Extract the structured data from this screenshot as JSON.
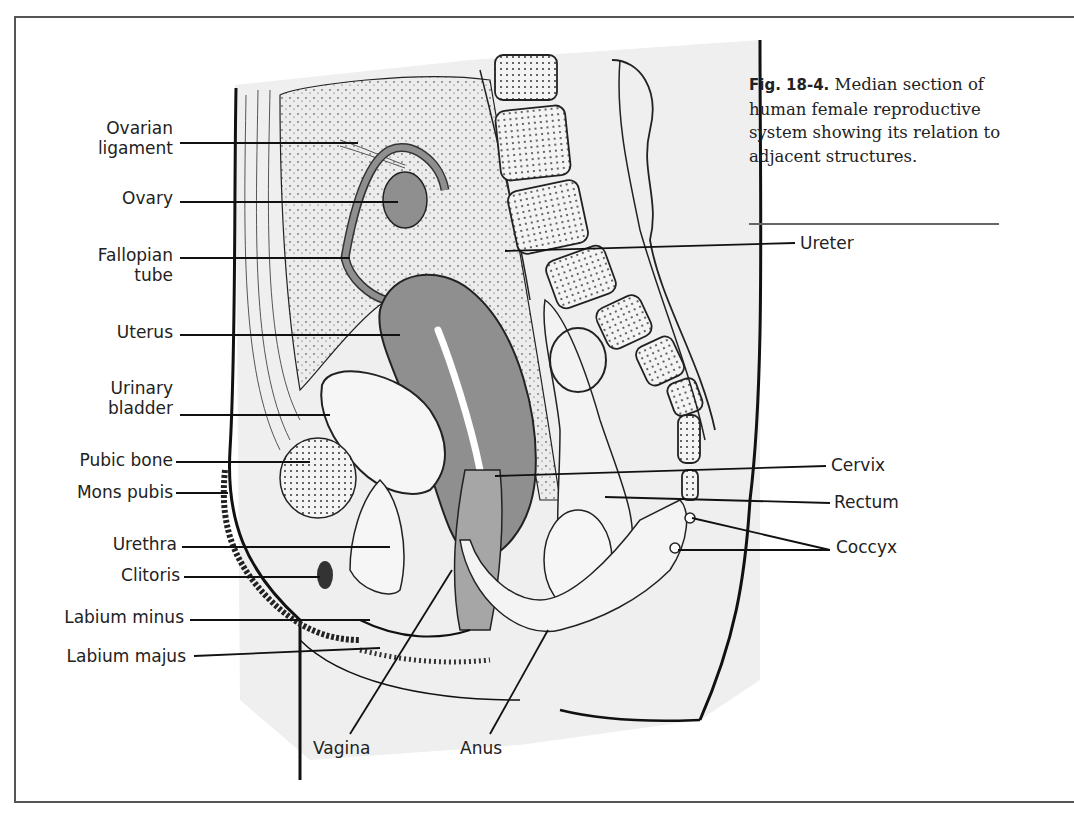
{
  "figure": {
    "number": "Fig. 18-4.",
    "caption": "Median section of human female reproductive system showing its relation to adjacent structures."
  },
  "labels_left": [
    {
      "id": "ovarian-ligament",
      "lines": [
        "Ovarian",
        "ligament"
      ]
    },
    {
      "id": "ovary",
      "lines": [
        "Ovary"
      ]
    },
    {
      "id": "fallopian-tube",
      "lines": [
        "Fallopian",
        "tube"
      ]
    },
    {
      "id": "uterus",
      "lines": [
        "Uterus"
      ]
    },
    {
      "id": "urinary-bladder",
      "lines": [
        "Urinary",
        "bladder"
      ]
    },
    {
      "id": "pubic-bone",
      "lines": [
        "Pubic bone"
      ]
    },
    {
      "id": "mons-pubis",
      "lines": [
        "Mons pubis"
      ]
    },
    {
      "id": "urethra",
      "lines": [
        "Urethra"
      ]
    },
    {
      "id": "clitoris",
      "lines": [
        "Clitoris"
      ]
    },
    {
      "id": "labium-minus",
      "lines": [
        "Labium minus"
      ]
    },
    {
      "id": "labium-majus",
      "lines": [
        "Labium majus"
      ]
    }
  ],
  "labels_right": [
    {
      "id": "ureter",
      "text": "Ureter"
    },
    {
      "id": "cervix",
      "text": "Cervix"
    },
    {
      "id": "rectum",
      "text": "Rectum"
    },
    {
      "id": "coccyx",
      "text": "Coccyx"
    }
  ],
  "labels_bottom": [
    {
      "id": "vagina",
      "text": "Vagina"
    },
    {
      "id": "anus",
      "text": "Anus"
    }
  ],
  "colors": {
    "organ_shade": "#8f8f8f",
    "background_tissue": "#efefef",
    "line": "#1a1a1a"
  }
}
